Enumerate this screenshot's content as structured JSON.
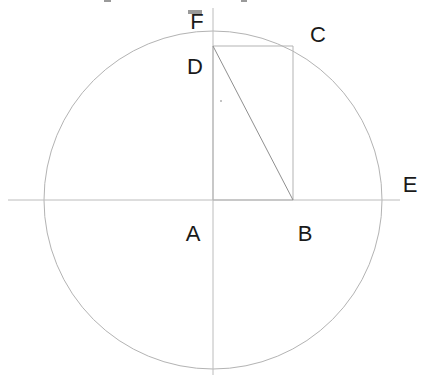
{
  "figure": {
    "background_color": "#ffffff",
    "width": 428,
    "height": 383
  },
  "style": {
    "stroke_color": "#b3b3b3",
    "axis_color": "#bcbcbc",
    "label_color": "#1a1a1a",
    "stroke_width": 1,
    "label_font_size": 22
  },
  "geometry": {
    "circle": {
      "center_x": 213,
      "center_y": 200,
      "radius": 169
    },
    "axes": {
      "horizontal": {
        "x1": 8,
        "y1": 200,
        "x2": 400,
        "y2": 200
      },
      "vertical": {
        "x1": 213,
        "y1": 8,
        "x2": 213,
        "y2": 375
      }
    },
    "rectangle": {
      "left": 213,
      "top": 46,
      "right": 293,
      "bottom": 200
    },
    "diagonal": {
      "x1": 213,
      "y1": 46,
      "x2": 293,
      "y2": 200
    },
    "stray_mark": {
      "x": 220,
      "y": 100,
      "width": 2,
      "height": 2
    }
  },
  "labels": [
    {
      "text": "F",
      "name": "point-label-f",
      "x": 197,
      "y": 22
    },
    {
      "text": "C",
      "name": "point-label-c",
      "x": 318,
      "y": 35
    },
    {
      "text": "D",
      "name": "point-label-d",
      "x": 195,
      "y": 67
    },
    {
      "text": "E",
      "name": "point-label-e",
      "x": 410,
      "y": 185
    },
    {
      "text": "A",
      "name": "point-label-a",
      "x": 193,
      "y": 234
    },
    {
      "text": "B",
      "name": "point-label-b",
      "x": 305,
      "y": 234
    }
  ],
  "top_edge_artifacts": [
    {
      "x": 104,
      "y": 0,
      "width": 7,
      "height": 2
    },
    {
      "x": 188,
      "y": 10,
      "width": 14,
      "height": 4
    },
    {
      "x": 241,
      "y": 0,
      "width": 6,
      "height": 2
    }
  ]
}
